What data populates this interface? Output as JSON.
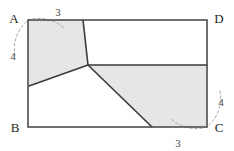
{
  "figure": {
    "colors": {
      "outline": "#4d4d4d",
      "partition_line": "#3a3a3a",
      "shaded_fill": "#e6e6e6",
      "unshaded_fill": "#ffffff",
      "arc": "#9a9a9a",
      "label_text": "#231f20",
      "measure_text": "#4a4a4a",
      "background": "#ffffff"
    },
    "vertices": [
      {
        "id": "A",
        "label": "A",
        "corner": "top-left",
        "x": 28,
        "y": 20
      },
      {
        "id": "D",
        "label": "D",
        "corner": "top-right",
        "x": 207,
        "y": 20
      },
      {
        "id": "B",
        "label": "B",
        "corner": "bottom-left",
        "x": 28,
        "y": 127
      },
      {
        "id": "C",
        "label": "C",
        "corner": "bottom-right",
        "x": 207,
        "y": 127
      }
    ],
    "measures": [
      {
        "id": "a-top",
        "value": "3",
        "near": "A",
        "along": "top-edge",
        "x": 58,
        "y": 15
      },
      {
        "id": "a-left",
        "value": "4",
        "near": "A",
        "along": "left-edge",
        "x": 14,
        "y": 57
      },
      {
        "id": "c-right",
        "value": "4",
        "near": "C",
        "along": "right-edge",
        "x": 219,
        "y": 103
      },
      {
        "id": "c-bottom",
        "value": "3",
        "near": "C",
        "along": "bottom-edge",
        "x": 178,
        "y": 146
      }
    ],
    "regions": [
      {
        "id": "upper-left-quad",
        "name": "shaded-quad-upper-left",
        "shaded": true,
        "points": "28,20 83,20 88,65 29,86"
      },
      {
        "id": "right-pentagon",
        "name": "shaded-pentagon-right",
        "shaded": true,
        "points": "88,65 207,65 207,127 152,127"
      },
      {
        "id": "upper-right-unshaded",
        "name": "unshaded-region-upper-right",
        "shaded": false,
        "points": "83,20 207,20 207,65 88,65"
      },
      {
        "id": "lower-left-unshaded",
        "name": "unshaded-region-lower-left",
        "shaded": false,
        "points": "29,86 88,65 152,127 28,127"
      }
    ],
    "partition_edges": [
      {
        "id": "edge-a-top-to-junction",
        "x1": 83,
        "y1": 20,
        "x2": 88,
        "y2": 65
      },
      {
        "id": "edge-junction-to-left",
        "x1": 88,
        "y1": 65,
        "x2": 29,
        "y2": 86
      },
      {
        "id": "edge-junction-to-right",
        "x1": 88,
        "y1": 65,
        "x2": 207,
        "y2": 65
      },
      {
        "id": "edge-junction-to-bottom",
        "x1": 88,
        "y1": 65,
        "x2": 152,
        "y2": 127
      }
    ],
    "junction": {
      "id": "interior-junction-point",
      "x": 88,
      "y": 65
    },
    "arcs": [
      {
        "id": "arc-at-a",
        "cx": 28,
        "cy": 20,
        "r": 38,
        "start_deg": 250,
        "end_deg": 420
      },
      {
        "id": "arc-at-c",
        "cx": 207,
        "cy": 127,
        "r": 38,
        "start_deg": 70,
        "end_deg": 240
      }
    ]
  }
}
